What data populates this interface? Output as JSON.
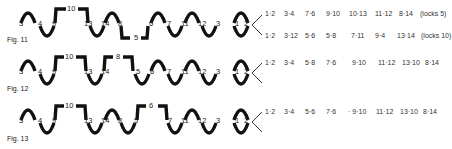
{
  "figures": [
    {
      "label": "Fig. 11",
      "node_labels": [
        "3",
        "4",
        "9",
        "10",
        "13",
        "14",
        "8",
        "5",
        "6",
        "7",
        "11",
        "12",
        "3",
        "1",
        "2"
      ],
      "pair_rows": [
        {
          "pairs": [
            "1·2",
            "3·4",
            "7·6",
            "9·10",
            "10·13",
            "11·12",
            "8·14"
          ],
          "note": "(locks 5)"
        },
        {
          "pairs": [
            "1·2",
            "3·12",
            "5·6",
            "5·8",
            "7·11",
            "9·4",
            "13·14"
          ],
          "note": "(locks 10)"
        }
      ]
    },
    {
      "label": "Fig. 12",
      "node_labels": [
        "3",
        "4",
        "9",
        "10",
        "13",
        "14",
        "8",
        "5",
        "6",
        "7",
        "11",
        "12",
        "3",
        "1",
        "2"
      ],
      "pair_rows": [
        {
          "pairs": [
            "1·2",
            "3·4",
            "5·8",
            "7·6",
            "9·10",
            "11·12",
            "13·10",
            "8·14"
          ],
          "note": ""
        }
      ]
    },
    {
      "label": "Fig. 13",
      "node_labels": [
        "3",
        "4",
        "9",
        "10",
        "13",
        "14",
        "8",
        "5",
        "6",
        "7",
        "11",
        "12",
        "3",
        "1",
        "2"
      ],
      "pair_rows": [
        {
          "pairs": [
            "1·2",
            "3·4",
            "5·6",
            "7·6",
            "· 9·10",
            "11·12",
            "13·10",
            "8·14"
          ],
          "note": ""
        }
      ]
    }
  ]
}
